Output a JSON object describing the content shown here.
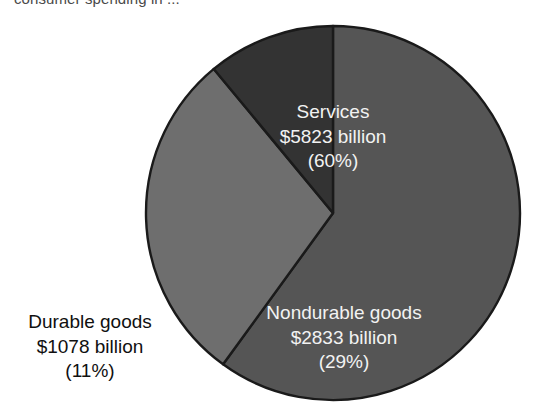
{
  "caption": {
    "text": "consumer spending in ..."
  },
  "chart_data": {
    "type": "pie",
    "title": "",
    "legend_position": "inline-labels",
    "value_unit": "billion",
    "currency_symbol": "$",
    "total_value": 9734,
    "categories": [
      "Services",
      "Nondurable goods",
      "Durable goods"
    ],
    "values": [
      5823,
      2833,
      1078
    ],
    "percentages": [
      60,
      29,
      11
    ],
    "colors": [
      "#555555",
      "#6e6e6e",
      "#333333"
    ],
    "slice_border_color": "#1a1a1a",
    "start_angle_deg": 270,
    "direction": "clockwise",
    "slices": [
      {
        "name": "Services",
        "value": 5823,
        "percent": 60,
        "color": "#555555",
        "label_placement": "inside",
        "label_lines": [
          "Services",
          "$5823 billion",
          "(60%)"
        ]
      },
      {
        "name": "Nondurable goods",
        "value": 2833,
        "percent": 29,
        "color": "#6e6e6e",
        "label_placement": "inside",
        "label_lines": [
          "Nondurable goods",
          "$2833 billion",
          "(29%)"
        ]
      },
      {
        "name": "Durable goods",
        "value": 1078,
        "percent": 11,
        "color": "#333333",
        "label_placement": "outside",
        "label_lines": [
          "Durable goods",
          "$1078 billion",
          "(11%)"
        ]
      }
    ]
  },
  "labels": {
    "services": {
      "line1": "Services",
      "line2": "$5823 billion",
      "line3": "(60%)"
    },
    "nondurable": {
      "line1": "Nondurable goods",
      "line2": "$2833 billion",
      "line3": "(29%)"
    },
    "durable": {
      "line1": "Durable goods",
      "line2": "$1078 billion",
      "line3": "(11%)"
    }
  }
}
